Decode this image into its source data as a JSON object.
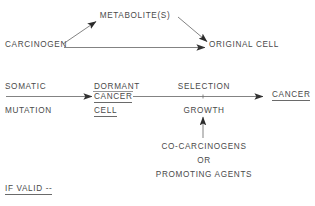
{
  "diagram": {
    "ink_color": "#4a4a4a",
    "background_color": "#ffffff",
    "nodes": {
      "metabolites": "METABOLITE(S)",
      "carcinogen": "CARCINOGEN",
      "original_cell": "ORIGINAL CELL",
      "somatic": "SOMATIC",
      "mutation": "MUTATION",
      "dormant": "DORMANT",
      "cancer_cell_line2": "CANCER",
      "cancer_cell_line3": "CELL",
      "selection": "SELECTION",
      "growth": "GROWTH",
      "cancer": "CANCER",
      "co_carcinogens": "CO-CARCINOGENS",
      "or": "OR",
      "promoting_agents": "PROMOTING AGENTS",
      "if_valid": "IF VALID --"
    },
    "edges": [
      {
        "name": "carcinogen-to-metabolites",
        "from": "CARCINOGEN",
        "to": "METABOLITE(S)",
        "style": "diagonal-arrow-up-right"
      },
      {
        "name": "metabolites-to-original-cell",
        "from": "METABOLITE(S)",
        "to": "ORIGINAL CELL",
        "style": "diagonal-arrow-down-right"
      },
      {
        "name": "carcinogen-to-original-cell",
        "from": "CARCINOGEN",
        "to": "ORIGINAL CELL",
        "style": "horizontal-arrow-right"
      },
      {
        "name": "somatic-mutation-to-dormant-cancer-cell",
        "from": "SOMATIC MUTATION",
        "to": "DORMANT CANCER CELL",
        "style": "horizontal-arrow-right"
      },
      {
        "name": "dormant-cancer-cell-to-cancer",
        "from": "DORMANT CANCER CELL",
        "to": "CANCER",
        "style": "horizontal-arrow-right"
      },
      {
        "name": "co-carcinogens-to-growth",
        "from": "CO-CARCINOGENS OR PROMOTING AGENTS",
        "to": "GROWTH",
        "style": "vertical-arrow-up"
      }
    ]
  }
}
